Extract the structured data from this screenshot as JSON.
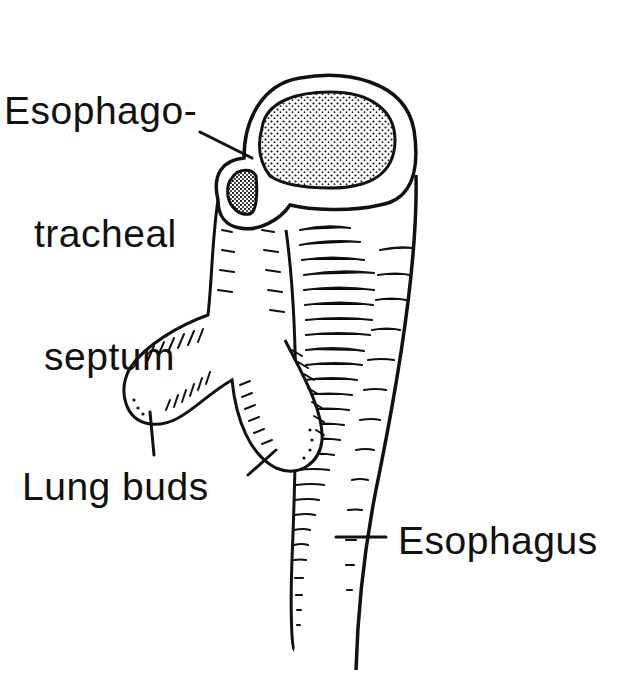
{
  "figure": {
    "colors": {
      "ink": "#111111",
      "background": "#ffffff"
    }
  },
  "labels": {
    "septum": {
      "line1": "Esophago-",
      "line2": "tracheal",
      "line3": "septum"
    },
    "lung_buds": "Lung buds",
    "esophagus": "Esophagus"
  }
}
